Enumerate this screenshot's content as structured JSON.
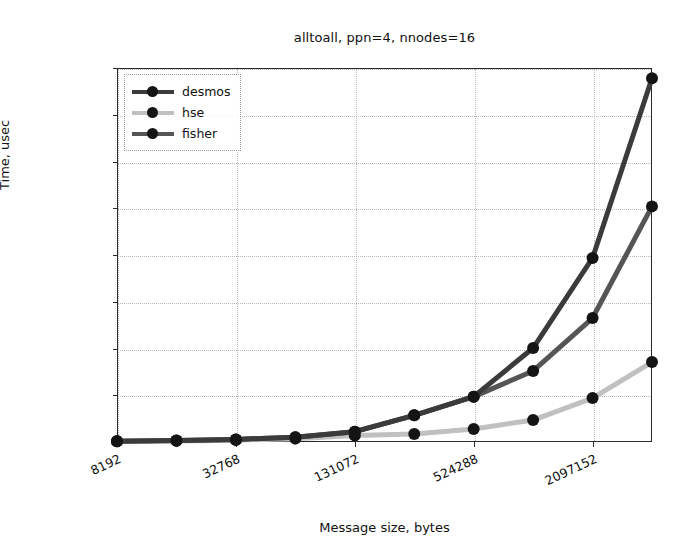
{
  "chart_data": {
    "type": "line",
    "title": "alltoall, ppn=4, nnodes=16",
    "xlabel": "Message size, bytes",
    "ylabel": "Time, usec",
    "xscale": "log2",
    "grid": true,
    "legend_position": "upper left",
    "x": [
      8192,
      16384,
      32768,
      65536,
      131072,
      262144,
      524288,
      1048576,
      2097152,
      4194304
    ],
    "xtick_labels": [
      "8192",
      "32768",
      "131072",
      "524288",
      "2097152"
    ],
    "xticks": [
      8192,
      32768,
      131072,
      524288,
      2097152
    ],
    "ytick_labels": [
      "0",
      "50000",
      "100000",
      "150000",
      "200000",
      "250000",
      "300000",
      "350000",
      "400000"
    ],
    "yticks": [
      0,
      50000,
      100000,
      150000,
      200000,
      250000,
      300000,
      350000,
      400000
    ],
    "ylim": [
      0,
      400000
    ],
    "series": [
      {
        "name": "desmos",
        "color": "#3b3b3b",
        "values": [
          900,
          1600,
          2800,
          5200,
          11000,
          28500,
          48500,
          100500,
          196800,
          389000
        ]
      },
      {
        "name": "hse",
        "color": "#c0c0c0",
        "values": [
          700,
          1200,
          2000,
          3600,
          7000,
          8500,
          14000,
          23500,
          47000,
          85500
        ]
      },
      {
        "name": "fisher",
        "color": "#555555",
        "values": [
          900,
          1600,
          2800,
          5200,
          11000,
          28500,
          48500,
          76000,
          132600,
          252000
        ]
      }
    ]
  },
  "legend": {
    "items": [
      {
        "label": "desmos"
      },
      {
        "label": "hse"
      },
      {
        "label": "fisher"
      }
    ]
  }
}
